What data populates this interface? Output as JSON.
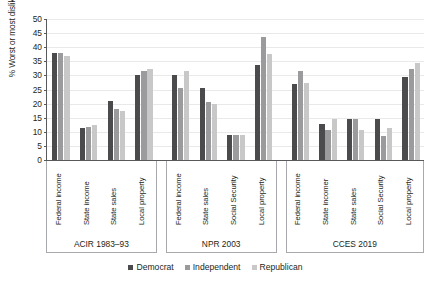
{
  "chart_data": {
    "type": "bar",
    "title": "",
    "xlabel": "",
    "ylabel": "% Worst or most disliked tax",
    "ylim": [
      0,
      50
    ],
    "ytick_step": 5,
    "yticks": [
      "50",
      "45",
      "40",
      "35",
      "30",
      "25",
      "20",
      "15",
      "10",
      "5",
      "0"
    ],
    "grid": true,
    "legend_position": "bottom",
    "series": [
      {
        "name": "Democrat",
        "color": "#4b4a4c"
      },
      {
        "name": "Independent",
        "color": "#9b9b9d"
      },
      {
        "name": "Republican",
        "color": "#c8c8c9"
      }
    ],
    "groups": [
      {
        "label": "ACIR 1983–93",
        "categories": [
          {
            "label": "Federal income",
            "values": [
              37.8,
              37.8,
              36.9
            ]
          },
          {
            "label": "State income",
            "values": [
              11.2,
              11.7,
              12.5
            ]
          },
          {
            "label": "State sales",
            "values": [
              20.8,
              18.1,
              17.4
            ]
          },
          {
            "label": "Local property",
            "values": [
              30.0,
              31.7,
              32.2
            ]
          }
        ]
      },
      {
        "label": "NPR 2003",
        "categories": [
          {
            "label": "Federal income",
            "values": [
              30.0,
              25.7,
              31.7
            ]
          },
          {
            "label": "State sales",
            "values": [
              25.7,
              20.6,
              19.8
            ]
          },
          {
            "label": "Social Security",
            "values": [
              8.9,
              8.9,
              8.9
            ]
          },
          {
            "label": "Local property",
            "values": [
              33.7,
              43.7,
              37.7
            ]
          }
        ]
      },
      {
        "label": "CCES 2019",
        "categories": [
          {
            "label": "Federal income",
            "values": [
              26.8,
              31.7,
              27.2
            ]
          },
          {
            "label": "State incomer",
            "values": [
              12.6,
              10.5,
              14.5
            ]
          },
          {
            "label": "State sales",
            "values": [
              14.6,
              14.6,
              10.5
            ]
          },
          {
            "label": "Social Security",
            "values": [
              14.6,
              8.5,
              11.3
            ]
          },
          {
            "label": "Local property",
            "values": [
              29.5,
              32.4,
              34.4
            ]
          }
        ]
      }
    ]
  }
}
